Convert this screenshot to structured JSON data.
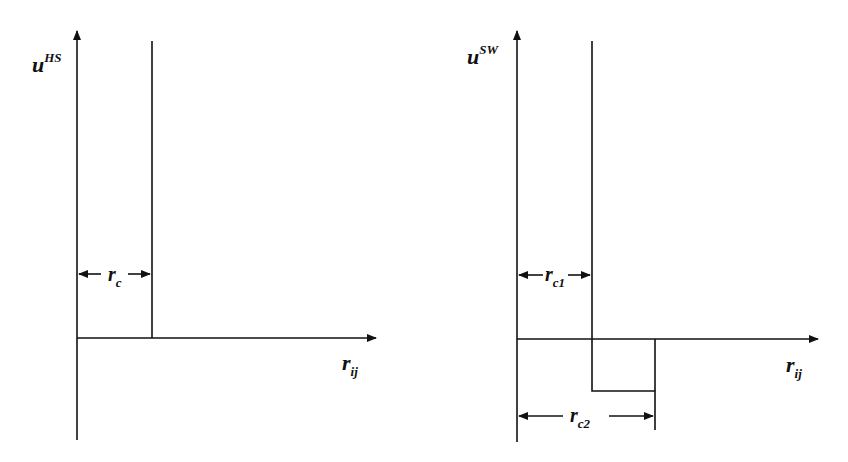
{
  "panels": [
    {
      "id": "hard-sphere",
      "y_label": {
        "base": "u",
        "sup": "HS"
      },
      "x_label": {
        "base": "r",
        "sub": "ij"
      },
      "dims": [
        {
          "base": "r",
          "sub": "c"
        }
      ]
    },
    {
      "id": "square-well",
      "y_label": {
        "base": "u",
        "sup": "SW"
      },
      "x_label": {
        "base": "r",
        "sub": "ij"
      },
      "dims": [
        {
          "base": "r",
          "sub": "c1"
        },
        {
          "base": "r",
          "sub": "c2"
        }
      ]
    }
  ],
  "colors": {
    "line": "#111111",
    "background": "#ffffff"
  }
}
